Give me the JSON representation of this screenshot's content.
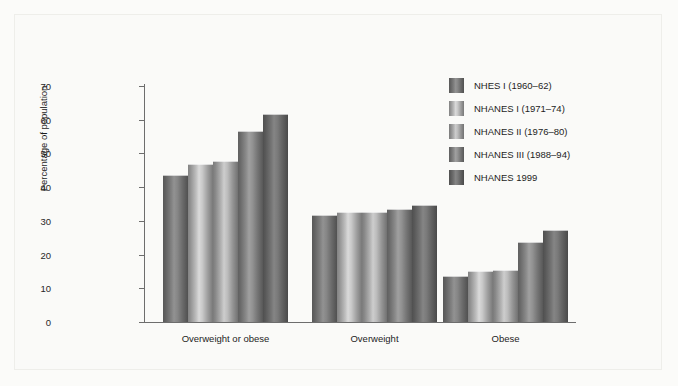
{
  "chart_data": {
    "type": "bar",
    "title": "",
    "xlabel": "",
    "ylabel": "Percentage of population",
    "ylim": [
      0,
      70
    ],
    "yticks": [
      0,
      10,
      20,
      30,
      40,
      50,
      60,
      70
    ],
    "grid": false,
    "legend_position": "right",
    "categories": [
      "Overweight or obese",
      "Overweight",
      "Obese"
    ],
    "series": [
      {
        "name": "NHES I (1960–62)",
        "values": [
          43.3,
          31.5,
          13.4
        ],
        "color": "#7a7a7a"
      },
      {
        "name": "NHANES I (1971–74)",
        "values": [
          46.6,
          32.4,
          14.9
        ],
        "color": "#b6b6b6"
      },
      {
        "name": "NHANES II (1976–80)",
        "values": [
          47.4,
          32.3,
          15.1
        ],
        "color": "#ababab"
      },
      {
        "name": "NHANES III (1988–94)",
        "values": [
          56.5,
          33.3,
          23.4
        ],
        "color": "#858585"
      },
      {
        "name": "NHANES 1999",
        "values": [
          61.4,
          34.5,
          27.0
        ],
        "color": "#6f6f6f"
      }
    ]
  },
  "axis": {
    "y_title": "Percentage of population",
    "y_tick_labels": [
      "0",
      "10",
      "20",
      "30",
      "40",
      "50",
      "60",
      "70"
    ]
  },
  "legend": {
    "items": [
      {
        "label": "NHES I (1960–62)"
      },
      {
        "label": "NHANES I (1971–74)"
      },
      {
        "label": "NHANES II (1976–80)"
      },
      {
        "label": "NHANES III (1988–94)"
      },
      {
        "label": "NHANES 1999"
      }
    ]
  },
  "x_labels": [
    "Overweight or obese",
    "Overweight",
    "Obese"
  ]
}
